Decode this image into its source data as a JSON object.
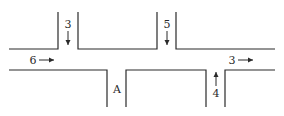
{
  "diagram": {
    "type": "road-intersection-traffic-flow",
    "stroke_color": "#2a2a2a",
    "background": "#ffffff",
    "flows": [
      {
        "id": "top-left-in",
        "value": "3",
        "direction": "down"
      },
      {
        "id": "top-right-in",
        "value": "5",
        "direction": "down"
      },
      {
        "id": "left-in",
        "value": "6",
        "direction": "right"
      },
      {
        "id": "right-out",
        "value": "3",
        "direction": "right"
      },
      {
        "id": "bottom-right-in",
        "value": "4",
        "direction": "up"
      }
    ],
    "unknown_label": "A"
  }
}
